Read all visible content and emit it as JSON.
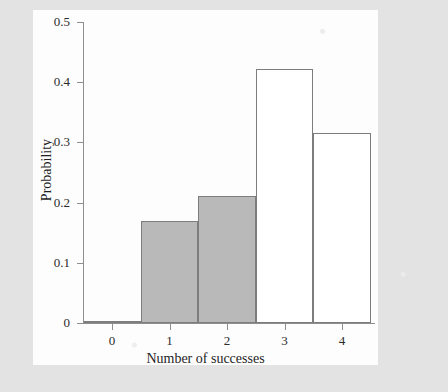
{
  "chart_data": {
    "type": "bar",
    "title": "",
    "subtitle": "",
    "xlabel": "Number of successes",
    "ylabel": "Probability",
    "categories": [
      "0",
      "1",
      "2",
      "3",
      "4"
    ],
    "values": [
      0.004,
      0.17,
      0.211,
      0.422,
      0.316
    ],
    "bar_styles": [
      "filled",
      "filled",
      "filled",
      "hollow",
      "hollow"
    ],
    "xlim": [
      -0.5,
      4.5
    ],
    "ylim": [
      0,
      0.5
    ],
    "y_ticks": [
      0,
      0.1,
      0.2,
      0.3,
      0.4,
      0.5
    ],
    "y_tick_labels": [
      "0",
      "0.1",
      "0.2",
      "0.3",
      "0.4",
      "0.5"
    ],
    "x_ticks": [
      0,
      1,
      2,
      3,
      4
    ],
    "x_tick_labels": [
      "0",
      "1",
      "2",
      "3",
      "4"
    ],
    "grid": false,
    "legend": null,
    "legend_position": "none",
    "annotations": [],
    "colors": {
      "bar_fill": "#b9b9b9",
      "bar_hollow_fill": "#ffffff",
      "bar_edge": "#7d7d7d",
      "axis": "#8e8e8e",
      "panel_background": "#fdfdfd",
      "page_background": "#e3e3e3",
      "text": "#1f1f1f"
    }
  }
}
